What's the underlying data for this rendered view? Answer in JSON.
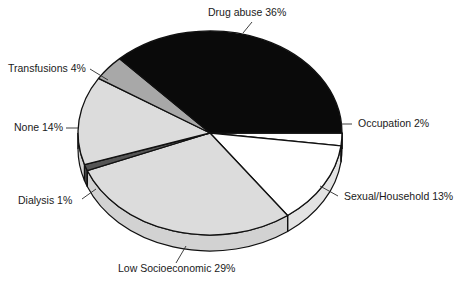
{
  "chart_data": {
    "type": "pie",
    "title": "",
    "subtitle": "",
    "xlabel": "",
    "ylabel": "",
    "legend_position": "none",
    "grid": false,
    "three_d": true,
    "start_angle_deg": 0,
    "direction": "clockwise",
    "categories": [
      "Occupation",
      "Sexual/Household",
      "Low Socioeconomic",
      "Dialysis",
      "None",
      "Transfusions",
      "Drug abuse"
    ],
    "values": [
      2,
      13,
      29,
      1,
      14,
      4,
      36
    ],
    "unit": "%",
    "total": 99,
    "slices": [
      {
        "name": "Occupation",
        "value": 2,
        "label": "Occupation 2%",
        "color": "#ffffff",
        "side_color": "#e8e8e8",
        "start_deg": 0,
        "end_deg": 7.2,
        "label_x": 358,
        "label_y": 127,
        "label_anchor": "start",
        "leader": "M 341,124 L 352,124"
      },
      {
        "name": "Sexual/Household",
        "value": 13,
        "label": "Sexual/Household 13%",
        "color": "#ffffff",
        "side_color": "#e3e3e3",
        "start_deg": 7.2,
        "end_deg": 54.0,
        "label_x": 344,
        "label_y": 200,
        "label_anchor": "start",
        "leader": "M 320,186 L 338,196"
      },
      {
        "name": "Low Socioeconomic",
        "value": 29,
        "label": "Low Socioeconomic 29%",
        "color": "#dcdcdc",
        "side_color": "#d2d2d2",
        "start_deg": 54.0,
        "end_deg": 158.4,
        "label_x": 118,
        "label_y": 272,
        "label_anchor": "start",
        "leader": "M 186,246 L 176,263"
      },
      {
        "name": "Dialysis",
        "value": 1,
        "label": "Dialysis 1%",
        "color": "#555555",
        "side_color": "#4a4a4a",
        "start_deg": 158.4,
        "end_deg": 162.0,
        "label_x": 18,
        "label_y": 204,
        "label_anchor": "start",
        "leader": "M 96,189 L 82,199"
      },
      {
        "name": "None",
        "value": 14,
        "label": "None 14%",
        "color": "#dcdcdc",
        "side_color": "#d2d2d2",
        "start_deg": 162.0,
        "end_deg": 212.4,
        "label_x": 14,
        "label_y": 131,
        "label_anchor": "start",
        "leader": "M 78,128 L 66,128"
      },
      {
        "name": "Transfusions",
        "value": 4,
        "label": "Transfusions 4%",
        "color": "#a8a8a8",
        "side_color": "#9c9c9c",
        "start_deg": 212.4,
        "end_deg": 226.8,
        "label_x": 8,
        "label_y": 72,
        "label_anchor": "start",
        "leader": "M 108,80 L 90,69"
      },
      {
        "name": "Drug abuse",
        "value": 36,
        "label": "Drug abuse 36%",
        "color": "#0a0a0a",
        "side_color": "#0a0a0a",
        "start_deg": 226.8,
        "end_deg": 360.0,
        "label_x": 208,
        "label_y": 16,
        "label_anchor": "start",
        "leader": "M 243,33 L 252,22"
      }
    ],
    "geometry": {
      "center_x": 210,
      "center_y": 133,
      "radius_x": 132,
      "radius_y": 102,
      "depth": 16
    },
    "colors": {
      "outline": "#111111",
      "label_text": "#1a1a1a",
      "background": "#ffffff"
    }
  }
}
